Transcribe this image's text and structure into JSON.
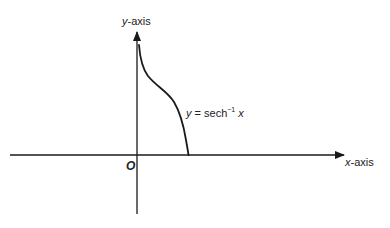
{
  "diagram": {
    "axes": {
      "x_label_var": "x",
      "x_label_suffix": "-axis",
      "y_label_var": "y",
      "y_label_suffix": "-axis",
      "origin_label": "O"
    },
    "curve": {
      "label_y": "y",
      "label_eq": " = sech",
      "label_sup": "−1",
      "label_x": " x",
      "function": "y = sech^-1 x",
      "domain": "0 < x ≤ 1",
      "behavior": "decreasing from +infinity near x=0 to y=0 at x=1"
    },
    "colors": {
      "stroke": "#1a1a1a",
      "background": "#ffffff",
      "text": "#222222"
    }
  }
}
